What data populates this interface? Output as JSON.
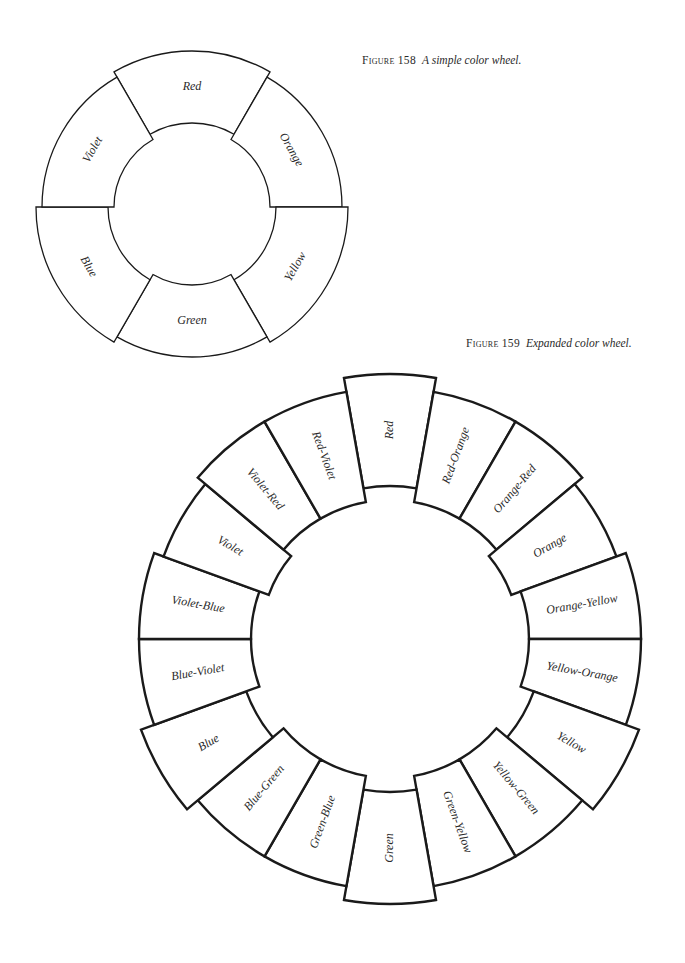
{
  "figures": [
    {
      "number_label": "Figure 158",
      "caption": "A simple color wheel.",
      "wheel": {
        "cx": 192,
        "cy": 207,
        "inner_r": 78,
        "outer_r": 150,
        "stroke_width": 1.3,
        "font_size": 12,
        "segment_span_deg": 60,
        "segments": [
          {
            "label": "Red",
            "angle": -90,
            "shift": 6,
            "text_rotate": 0
          },
          {
            "label": "Orange",
            "angle": -30,
            "shift": 0,
            "text_rotate": 60
          },
          {
            "label": "Yellow",
            "angle": 30,
            "shift": 6,
            "text_rotate": -60
          },
          {
            "label": "Green",
            "angle": 90,
            "shift": 0,
            "text_rotate": 0
          },
          {
            "label": "Blue",
            "angle": 150,
            "shift": 6,
            "text_rotate": 60
          },
          {
            "label": "Violet",
            "angle": 210,
            "shift": 0,
            "text_rotate": -60
          }
        ]
      }
    },
    {
      "number_label": "Figure 159",
      "caption": "Expanded color wheel.",
      "wheel": {
        "cx": 390,
        "cy": 639,
        "inner_r": 139,
        "outer_r": 251,
        "stroke_width": 2.4,
        "font_size": 12,
        "segment_span_deg": 20,
        "segments": [
          {
            "label": "Red",
            "angle": -90,
            "shift": 14,
            "text_rotate": -90
          },
          {
            "label": "Red-Orange",
            "angle": -70,
            "shift": 0,
            "text_rotate": -70
          },
          {
            "label": "Orange-Red",
            "angle": -50,
            "shift": 0,
            "text_rotate": -50
          },
          {
            "label": "Orange",
            "angle": -30,
            "shift": -10,
            "text_rotate": -30
          },
          {
            "label": "Orange-Yellow",
            "angle": -10,
            "shift": 0,
            "text_rotate": -10
          },
          {
            "label": "Yellow-Orange",
            "angle": 10,
            "shift": 0,
            "text_rotate": 10
          },
          {
            "label": "Yellow",
            "angle": 30,
            "shift": 14,
            "text_rotate": 30
          },
          {
            "label": "Yellow-Green",
            "angle": 50,
            "shift": 0,
            "text_rotate": 50
          },
          {
            "label": "Green-Yellow",
            "angle": 70,
            "shift": 0,
            "text_rotate": 70
          },
          {
            "label": "Green",
            "angle": 90,
            "shift": 14,
            "text_rotate": -90
          },
          {
            "label": "Green-Blue",
            "angle": 110,
            "shift": 0,
            "text_rotate": -70
          },
          {
            "label": "Blue-Green",
            "angle": 130,
            "shift": 0,
            "text_rotate": -50
          },
          {
            "label": "Blue",
            "angle": 150,
            "shift": 14,
            "text_rotate": -30
          },
          {
            "label": "Blue-Violet",
            "angle": 170,
            "shift": 0,
            "text_rotate": -10
          },
          {
            "label": "Violet-Blue",
            "angle": 190,
            "shift": 0,
            "text_rotate": 10
          },
          {
            "label": "Violet",
            "angle": 210,
            "shift": -10,
            "text_rotate": 30
          },
          {
            "label": "Violet-Red",
            "angle": 230,
            "shift": 0,
            "text_rotate": 50
          },
          {
            "label": "Red-Violet",
            "angle": 250,
            "shift": 0,
            "text_rotate": 70
          }
        ]
      }
    }
  ]
}
